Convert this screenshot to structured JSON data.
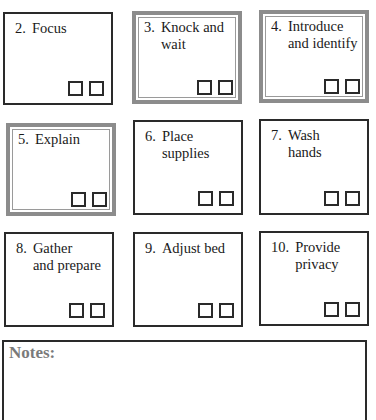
{
  "steps": [
    {
      "num": "2.",
      "text": "Focus",
      "style": "plain"
    },
    {
      "num": "3.",
      "text": "Knock and\nwait",
      "style": "gray"
    },
    {
      "num": "4.",
      "text": "Introduce\nand identify",
      "style": "gray"
    },
    {
      "num": "5.",
      "text": "Explain",
      "style": "gray"
    },
    {
      "num": "6.",
      "text": "Place\nsupplies",
      "style": "plain"
    },
    {
      "num": "7.",
      "text": "Wash\nhands",
      "style": "plain"
    },
    {
      "num": "8.",
      "text": "Gather\nand prepare",
      "style": "plain"
    },
    {
      "num": "9.",
      "text": "Adjust bed",
      "style": "plain"
    },
    {
      "num": "10.",
      "text": "Provide\nprivacy",
      "style": "plain"
    }
  ],
  "notes": {
    "title": "Notes:"
  },
  "colors": {
    "frame_dark": "#2a2a2a",
    "frame_gray": "#8c8c8c",
    "notes_title": "#7a7a7a"
  }
}
